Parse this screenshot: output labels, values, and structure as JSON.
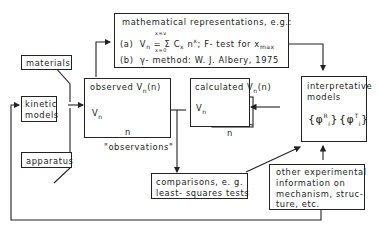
{
  "nodes": {
    "materials": {
      "label": "materials"
    },
    "kinetic_models": {
      "line1": "kinetic",
      "line2": "models"
    },
    "apparatus": {
      "label": "apparatus"
    },
    "math": {
      "title": "mathematical representations, e.g.:",
      "a_prefix": "(a)",
      "a_lhs": "V",
      "a_lhs_sub": "n",
      "a_eq": "=",
      "a_sum_top": "x=ν",
      "a_sum_sym": "Σ",
      "a_sum_bot": "x=0",
      "a_term": "C",
      "a_term_sub": "x",
      "a_term_n": " n",
      "a_term_sup": "x",
      "a_tail": ";  F- test for x",
      "a_tail_sub": "max",
      "b_prefix": "(b)",
      "b_symbol": "γ",
      "b_text": "- method: W. J. Albery, 1975"
    },
    "observed": {
      "title": "observed V",
      "title_sub": "n",
      "title_tail": "(n)",
      "ylabel": "V",
      "ylabel_sub": "n",
      "xlabel": "n",
      "caption": "\"observations\""
    },
    "calculated": {
      "title": "calculated  V",
      "title_sub": "n",
      "title_tail": "(n)",
      "ylabel": "V",
      "ylabel_sub": "n",
      "xlabel": "n"
    },
    "interpretative": {
      "line1": "interpretative",
      "line2": "models",
      "set1": "{φ",
      "set1_sup": "R",
      "set1_sub": "i",
      "set1_close": "}",
      "set2": "{φ",
      "set2_sup": "T",
      "set2_sub": "i",
      "set2_close": "}"
    },
    "comparisons": {
      "line1": "comparisons, e. g.",
      "line2": "least- squares tests"
    },
    "other_info": {
      "line1": "other  experimental",
      "line2": "information  on",
      "line3": "mechanism, struc-",
      "line4": "ture, etc."
    }
  }
}
